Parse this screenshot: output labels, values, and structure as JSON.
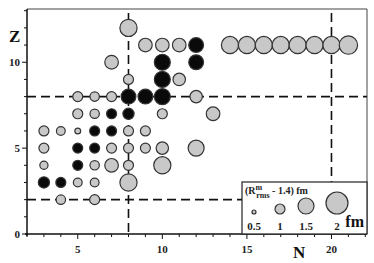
{
  "chart_data": {
    "type": "scatter",
    "subtype": "bubble",
    "title": "",
    "xlabel": "N",
    "ylabel": "Z",
    "xlim": [
      2,
      22.1
    ],
    "ylim": [
      0,
      13.1
    ],
    "grid": false,
    "x_ticks": [
      5,
      10,
      15,
      20
    ],
    "y_ticks": [
      0,
      5,
      10
    ],
    "x_minor_step": 1,
    "y_minor_step": 1,
    "reference_lines": {
      "horizontal": [
        2,
        8
      ],
      "vertical": [
        8,
        20
      ],
      "style": "dashed"
    },
    "legend": {
      "title": "(R^m_rms - 1.4) fm",
      "title_parts": {
        "base": "(R",
        "sup": "m",
        "sub": "rms",
        "rest": " - 1.4)  fm"
      },
      "position": "lower right",
      "sizes": [
        0.5,
        1,
        1.5,
        2
      ],
      "size_labels": [
        "0.5",
        "1",
        "1.5",
        "2"
      ],
      "unit": "fm"
    },
    "colors": {
      "gray": "#c8c8c8",
      "black": "#0a0a0a",
      "edge": "#333333"
    },
    "series": [
      {
        "name": "filled (black)",
        "color": "black",
        "points": [
          {
            "N": 3,
            "Z": 3,
            "size": 1.1
          },
          {
            "N": 4,
            "Z": 3,
            "size": 1.0
          },
          {
            "N": 5,
            "Z": 4,
            "size": 1.0
          },
          {
            "N": 5,
            "Z": 5,
            "size": 1.0
          },
          {
            "N": 6,
            "Z": 5,
            "size": 1.0
          },
          {
            "N": 6,
            "Z": 6,
            "size": 1.0
          },
          {
            "N": 7,
            "Z": 6,
            "size": 1.0
          },
          {
            "N": 7,
            "Z": 7,
            "size": 1.0
          },
          {
            "N": 8,
            "Z": 7,
            "size": 1.1
          },
          {
            "N": 8,
            "Z": 8,
            "size": 1.4
          },
          {
            "N": 9,
            "Z": 8,
            "size": 1.4
          },
          {
            "N": 10,
            "Z": 8,
            "size": 1.5
          },
          {
            "N": 10,
            "Z": 9,
            "size": 1.5
          },
          {
            "N": 10,
            "Z": 10,
            "size": 1.5
          },
          {
            "N": 12,
            "Z": 10,
            "size": 1.4
          },
          {
            "N": 12,
            "Z": 11,
            "size": 1.4
          }
        ]
      },
      {
        "name": "open (gray)",
        "color": "gray",
        "points": [
          {
            "N": 4,
            "Z": 2,
            "size": 0.95
          },
          {
            "N": 6,
            "Z": 2,
            "size": 1.0
          },
          {
            "N": 5,
            "Z": 3,
            "size": 0.9
          },
          {
            "N": 6,
            "Z": 3,
            "size": 0.9
          },
          {
            "N": 8,
            "Z": 3,
            "size": 1.6
          },
          {
            "N": 3,
            "Z": 4,
            "size": 0.85
          },
          {
            "N": 6,
            "Z": 4,
            "size": 0.95
          },
          {
            "N": 7,
            "Z": 4,
            "size": 1.3
          },
          {
            "N": 8,
            "Z": 4,
            "size": 1.0
          },
          {
            "N": 10,
            "Z": 4,
            "size": 1.6
          },
          {
            "N": 3,
            "Z": 5,
            "size": 1.0
          },
          {
            "N": 7,
            "Z": 5,
            "size": 1.0
          },
          {
            "N": 8,
            "Z": 5,
            "size": 1.0
          },
          {
            "N": 9,
            "Z": 5,
            "size": 1.0
          },
          {
            "N": 10,
            "Z": 5,
            "size": 1.2
          },
          {
            "N": 12,
            "Z": 5,
            "size": 1.5
          },
          {
            "N": 3,
            "Z": 6,
            "size": 1.0
          },
          {
            "N": 4,
            "Z": 6,
            "size": 0.9
          },
          {
            "N": 5,
            "Z": 6,
            "size": 0.65
          },
          {
            "N": 8,
            "Z": 6,
            "size": 1.0
          },
          {
            "N": 9,
            "Z": 6,
            "size": 1.0
          },
          {
            "N": 5,
            "Z": 7,
            "size": 1.0
          },
          {
            "N": 6,
            "Z": 7,
            "size": 0.95
          },
          {
            "N": 10,
            "Z": 7,
            "size": 1.0
          },
          {
            "N": 13,
            "Z": 7,
            "size": 1.3
          },
          {
            "N": 5,
            "Z": 8,
            "size": 1.0
          },
          {
            "N": 6,
            "Z": 8,
            "size": 0.95
          },
          {
            "N": 7,
            "Z": 8,
            "size": 1.0
          },
          {
            "N": 12,
            "Z": 8,
            "size": 1.2
          },
          {
            "N": 8,
            "Z": 9,
            "size": 1.0
          },
          {
            "N": 11,
            "Z": 9,
            "size": 1.2
          },
          {
            "N": 7,
            "Z": 10,
            "size": 1.3
          },
          {
            "N": 9,
            "Z": 11,
            "size": 1.3
          },
          {
            "N": 10,
            "Z": 11,
            "size": 1.3
          },
          {
            "N": 11,
            "Z": 11,
            "size": 1.3
          },
          {
            "N": 14,
            "Z": 11,
            "size": 1.6
          },
          {
            "N": 15,
            "Z": 11,
            "size": 1.6
          },
          {
            "N": 16,
            "Z": 11,
            "size": 1.6
          },
          {
            "N": 17,
            "Z": 11,
            "size": 1.6
          },
          {
            "N": 18,
            "Z": 11,
            "size": 1.6
          },
          {
            "N": 19,
            "Z": 11,
            "size": 1.6
          },
          {
            "N": 20,
            "Z": 11,
            "size": 1.6
          },
          {
            "N": 21,
            "Z": 11,
            "size": 1.7
          },
          {
            "N": 8,
            "Z": 12,
            "size": 1.6
          }
        ]
      }
    ]
  },
  "axes": {
    "x_label": "N",
    "y_label": "Z",
    "x_tick_labels": [
      "5",
      "10",
      "15",
      "20"
    ],
    "y_tick_labels": [
      "0",
      "5",
      "10"
    ]
  }
}
